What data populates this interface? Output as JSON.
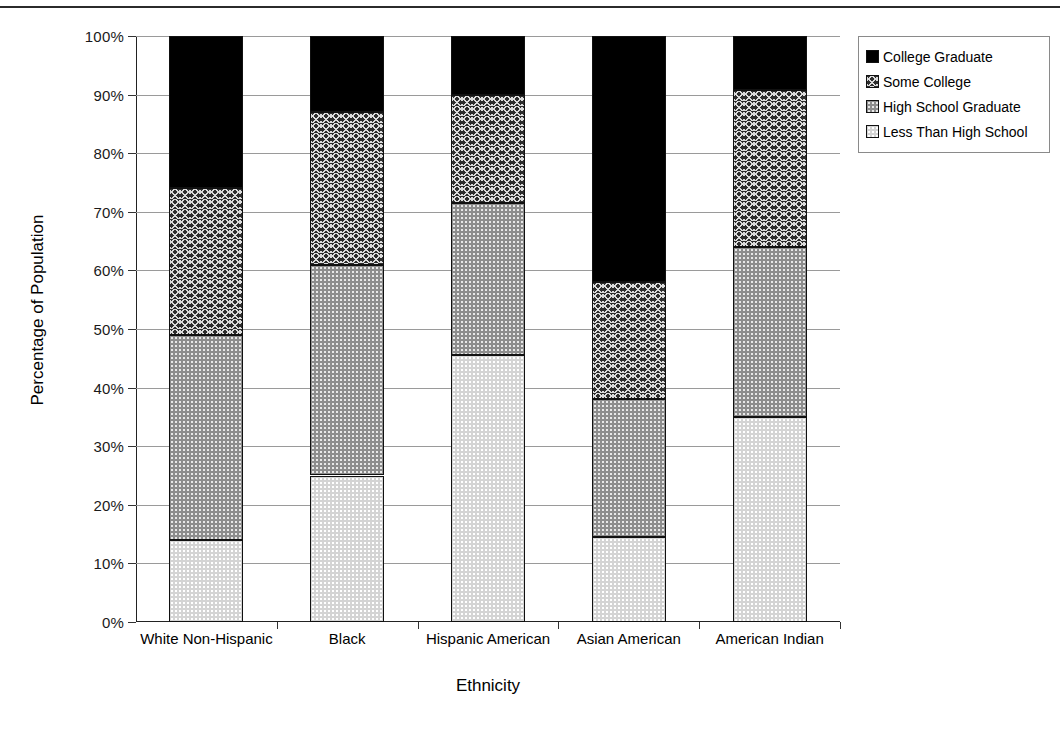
{
  "chart_data": {
    "type": "bar",
    "subtype": "stacked-bar-100-percent",
    "title": "",
    "xlabel": "Ethnicity",
    "ylabel": "Percentage of Population",
    "ylim": [
      0,
      100
    ],
    "ytick_labels": [
      "100%",
      "90%",
      "80%",
      "70%",
      "60%",
      "50%",
      "40%",
      "30%",
      "20%",
      "10%",
      "0%"
    ],
    "ytick_values": [
      100,
      90,
      80,
      70,
      60,
      50,
      40,
      30,
      20,
      10,
      0
    ],
    "grid": true,
    "legend_position": "top-right",
    "categories": [
      "White Non-Hispanic",
      "Black",
      "Hispanic American",
      "Asian American",
      "American Indian"
    ],
    "series": [
      {
        "name": "College Graduate",
        "swatch": "solid-black",
        "color": "#000000",
        "values": [
          26.0,
          13.0,
          10.0,
          42.0,
          9.2
        ]
      },
      {
        "name": "Some College",
        "swatch": "crosshatch-dark",
        "color": "#2e2e2e",
        "values": [
          25.0,
          26.0,
          18.5,
          20.0,
          26.8
        ]
      },
      {
        "name": "High School Graduate",
        "swatch": "dotted-gray",
        "color": "#8d8d8d",
        "values": [
          35.0,
          36.0,
          26.0,
          23.5,
          29.0
        ]
      },
      {
        "name": "Less Than High School",
        "swatch": "dotted-light",
        "color": "#d4d4d4",
        "values": [
          14.0,
          25.0,
          45.5,
          14.5,
          35.0
        ]
      }
    ],
    "cumulative_boundaries": [
      [
        14.0,
        49.0,
        74.0,
        100.0
      ],
      [
        25.0,
        61.0,
        87.0,
        100.0
      ],
      [
        45.5,
        71.5,
        90.0,
        100.0
      ],
      [
        14.5,
        38.0,
        58.0,
        100.0
      ],
      [
        35.0,
        64.0,
        90.8,
        100.0
      ]
    ]
  },
  "legend": {
    "items": [
      {
        "label": "College Graduate",
        "fill": "fill-college-graduate"
      },
      {
        "label": "Some College",
        "fill": "fill-some-college"
      },
      {
        "label": "High School Graduate",
        "fill": "fill-high-school-graduate"
      },
      {
        "label": "Less Than High School",
        "fill": "fill-less-than-high-school"
      }
    ]
  }
}
